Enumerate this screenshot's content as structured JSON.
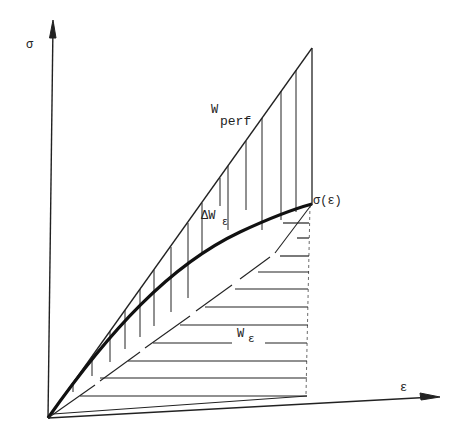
{
  "diagram": {
    "title": "",
    "axes": {
      "y_label": "σ",
      "x_label": "ε"
    },
    "labels": {
      "w_perf_base": "W",
      "w_perf_sub": "perf",
      "delta_w_base": "ΔW",
      "delta_w_sub": "ε",
      "w_eps_base": "W",
      "w_eps_sub": "ε",
      "curve_label": "σ(ε)"
    },
    "regions": [
      {
        "name": "W_perf",
        "description": "area between straight line and curve σ(ε), vertical hatching"
      },
      {
        "name": "ΔW_ε",
        "description": "area between curve σ(ε) and chord, vertical hatching"
      },
      {
        "name": "W_ε",
        "description": "area below chord, horizontal hatching"
      }
    ],
    "colors": {
      "ink": "#222222",
      "background": "#ffffff"
    }
  }
}
